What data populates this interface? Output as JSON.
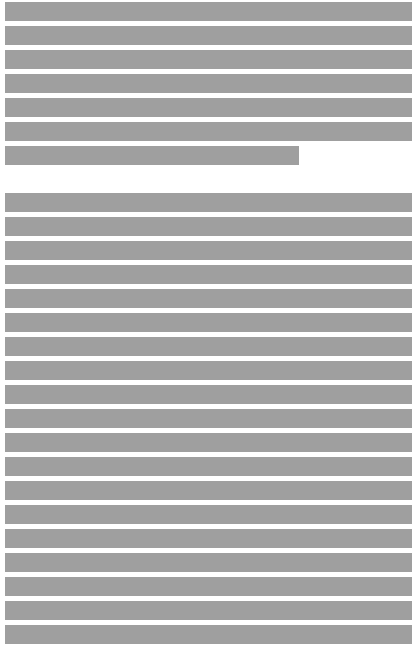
{
  "document": {
    "redaction_color": "#9f9f9f",
    "background_color": "#ffffff",
    "paragraphs": [
      {
        "line_count": 7,
        "lines": [
          "",
          "",
          "",
          "",
          "",
          "",
          ""
        ],
        "last_line_short": true
      },
      {
        "line_count": 19,
        "lines": [
          "",
          "",
          "",
          "",
          "",
          "",
          "",
          "",
          "",
          "",
          "",
          "",
          "",
          "",
          "",
          "",
          "",
          "",
          ""
        ],
        "last_line_short": false
      }
    ]
  }
}
